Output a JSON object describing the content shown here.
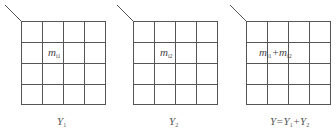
{
  "diagram": {
    "grid": {
      "rows": 4,
      "cols": 4,
      "line_color": "#555555"
    },
    "panels": [
      {
        "id": "Y1",
        "cell_label": {
          "base": "m",
          "sub": "i1",
          "row": 2,
          "col": 2
        },
        "caption": {
          "base": "Y",
          "sub": "1"
        }
      },
      {
        "id": "Y2",
        "cell_label": {
          "base": "m",
          "sub": "i2",
          "row": 2,
          "col": 2
        },
        "caption": {
          "base": "Y",
          "sub": "2"
        }
      },
      {
        "id": "Y",
        "cell_label": {
          "base1": "m",
          "sub1": "i1",
          "op": "+",
          "base2": "m",
          "sub2": "i2",
          "row": 2,
          "col": 2
        },
        "caption": {
          "lhs": "Y=",
          "base1": "Y",
          "sub1": "1",
          "op": "+",
          "base2": "Y",
          "sub2": "2"
        }
      }
    ]
  }
}
